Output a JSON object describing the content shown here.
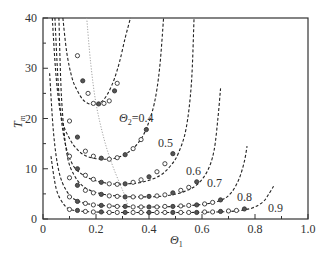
{
  "chart_data": {
    "type": "line",
    "title": "",
    "xlabel": "Θ1",
    "ylabel": "T_m",
    "xlim": [
      0,
      1.0
    ],
    "ylim": [
      0,
      40
    ],
    "xticks": [
      "0",
      "0.2",
      "0.4",
      "0.6",
      "0.8",
      "1.0"
    ],
    "yticks": [
      "0",
      "10",
      "20",
      "30",
      "40"
    ],
    "grid": false,
    "legend": "inline curve labels",
    "series": [
      {
        "name": "Θ2=0.4",
        "label": "Θ2=0.4",
        "x": [
          0.075,
          0.09,
          0.11,
          0.13,
          0.15,
          0.17,
          0.19,
          0.21,
          0.23,
          0.25,
          0.27,
          0.29,
          0.31,
          0.33
        ],
        "y": [
          40,
          33,
          28,
          25.5,
          23.8,
          23.0,
          22.8,
          23.0,
          23.8,
          25.5,
          28,
          31.5,
          36,
          40
        ]
      },
      {
        "name": "Θ2=0.5",
        "label": "0.5",
        "x": [
          0.035,
          0.05,
          0.07,
          0.1,
          0.13,
          0.16,
          0.2,
          0.24,
          0.28,
          0.32,
          0.36,
          0.39,
          0.42,
          0.44,
          0.455
        ],
        "y": [
          40,
          28,
          20,
          16,
          13.8,
          12.6,
          12.0,
          11.9,
          12.2,
          13.2,
          15.2,
          18,
          23,
          30,
          40
        ]
      },
      {
        "name": "Θ2=0.6",
        "label": "0.6",
        "x": [
          0.045,
          0.06,
          0.08,
          0.11,
          0.15,
          0.2,
          0.26,
          0.32,
          0.38,
          0.44,
          0.48,
          0.51,
          0.54,
          0.56,
          0.57
        ],
        "y": [
          40,
          25,
          16,
          11,
          8.8,
          7.6,
          7.0,
          7.0,
          7.4,
          8.6,
          10.5,
          13,
          18,
          27,
          40
        ]
      },
      {
        "name": "Θ2=0.7",
        "label": "0.7",
        "x": [
          0.06,
          0.07,
          0.09,
          0.12,
          0.16,
          0.22,
          0.3,
          0.38,
          0.46,
          0.53,
          0.58,
          0.62,
          0.645,
          0.66,
          0.67
        ],
        "y": [
          40,
          24,
          13,
          8.5,
          6.2,
          5.0,
          4.5,
          4.4,
          4.6,
          5.4,
          6.8,
          9.5,
          13.5,
          20,
          26
        ]
      },
      {
        "name": "Θ2=0.8",
        "label": "0.8",
        "x": [
          0.025,
          0.04,
          0.06,
          0.09,
          0.13,
          0.2,
          0.3,
          0.4,
          0.5,
          0.6,
          0.67,
          0.71,
          0.74,
          0.76,
          0.77
        ],
        "y": [
          29,
          17,
          9.5,
          5.5,
          3.6,
          2.8,
          2.5,
          2.4,
          2.5,
          2.9,
          3.7,
          5.2,
          8,
          11.5,
          14.5
        ]
      },
      {
        "name": "Θ2=0.9",
        "label": "0.9",
        "x": [
          0.03,
          0.05,
          0.08,
          0.11,
          0.16,
          0.25,
          0.35,
          0.45,
          0.55,
          0.65,
          0.73,
          0.79,
          0.83,
          0.85,
          0.87
        ],
        "y": [
          12.5,
          6,
          2.8,
          1.8,
          1.5,
          1.3,
          1.3,
          1.3,
          1.3,
          1.4,
          1.6,
          2.2,
          3.4,
          4.8,
          6.5
        ]
      },
      {
        "name": "minimum locus",
        "style": "dotted-gray",
        "x": [
          0.165,
          0.18,
          0.2,
          0.23,
          0.26,
          0.29,
          0.31,
          0.32
        ],
        "y": [
          40,
          31,
          23,
          16,
          11,
          7,
          4.5,
          2.5
        ]
      }
    ],
    "markers": [
      {
        "series": "Θ2=0.4",
        "x": [
          0.13,
          0.15,
          0.17,
          0.19,
          0.21,
          0.23,
          0.25,
          0.27,
          0.28
        ],
        "y": [
          32.5,
          27.5,
          25,
          23,
          22.9,
          23,
          23.5,
          25.5,
          27
        ]
      },
      {
        "series": "Θ2=0.5",
        "x": [
          0.1,
          0.13,
          0.16,
          0.19,
          0.22,
          0.25,
          0.28,
          0.31,
          0.34,
          0.37,
          0.39
        ],
        "y": [
          19.5,
          16.3,
          13.5,
          12.5,
          12.1,
          11.9,
          12.2,
          12.8,
          14,
          15.8,
          17.8
        ]
      },
      {
        "series": "Θ2=0.6",
        "x": [
          0.1,
          0.13,
          0.16,
          0.19,
          0.22,
          0.25,
          0.28,
          0.31,
          0.34,
          0.37,
          0.4,
          0.43,
          0.46,
          0.49
        ],
        "y": [
          12.5,
          10,
          8.7,
          7.9,
          7.3,
          7.0,
          6.9,
          7.0,
          7.3,
          7.8,
          8.4,
          9.4,
          11,
          13
        ]
      },
      {
        "series": "Θ2=0.7",
        "x": [
          0.1,
          0.13,
          0.16,
          0.19,
          0.22,
          0.25,
          0.28,
          0.31,
          0.34,
          0.37,
          0.4,
          0.43,
          0.46,
          0.49,
          0.52,
          0.55,
          0.58
        ],
        "y": [
          8.2,
          6.7,
          5.7,
          5.2,
          4.9,
          4.6,
          4.5,
          4.4,
          4.4,
          4.4,
          4.5,
          4.6,
          4.8,
          5.2,
          5.7,
          6.3,
          7.4
        ]
      },
      {
        "series": "Θ2=0.8",
        "x": [
          0.1,
          0.13,
          0.16,
          0.19,
          0.22,
          0.25,
          0.28,
          0.31,
          0.34,
          0.37,
          0.4,
          0.43,
          0.46,
          0.49,
          0.52,
          0.55,
          0.58,
          0.61,
          0.64,
          0.67
        ],
        "y": [
          4.4,
          3.5,
          3.1,
          2.8,
          2.7,
          2.6,
          2.5,
          2.5,
          2.4,
          2.4,
          2.4,
          2.4,
          2.5,
          2.5,
          2.6,
          2.7,
          2.8,
          3.0,
          3.3,
          3.8
        ]
      },
      {
        "series": "Θ2=0.9",
        "x": [
          0.1,
          0.13,
          0.16,
          0.19,
          0.22,
          0.25,
          0.28,
          0.31,
          0.34,
          0.37,
          0.4,
          0.43,
          0.46,
          0.49,
          0.52,
          0.55,
          0.58,
          0.61,
          0.64,
          0.67,
          0.7,
          0.73,
          0.76
        ],
        "y": [
          1.9,
          1.7,
          1.5,
          1.4,
          1.4,
          1.3,
          1.3,
          1.3,
          1.3,
          1.3,
          1.3,
          1.3,
          1.3,
          1.3,
          1.3,
          1.3,
          1.3,
          1.4,
          1.4,
          1.5,
          1.6,
          1.7,
          2.0
        ]
      }
    ],
    "annotations": [
      {
        "text": "Θ2=0.4",
        "x": 0.28,
        "y": 20.5
      },
      {
        "text": "0.5",
        "x": 0.425,
        "y": 14.7
      },
      {
        "text": "0.6",
        "x": 0.53,
        "y": 9.5
      },
      {
        "text": "0.7",
        "x": 0.63,
        "y": 6.8
      },
      {
        "text": "0.8",
        "x": 0.74,
        "y": 3.8
      },
      {
        "text": "0.9",
        "x": 0.855,
        "y": 1.3
      }
    ]
  },
  "plot": {
    "left": 43,
    "top": 18,
    "right": 308,
    "bottom": 219
  },
  "axes": {
    "xlabel_main": "Θ",
    "xlabel_sub": "1",
    "ylabel_main": "T",
    "ylabel_sub": "m"
  },
  "labels": {
    "theta2_main": "Θ",
    "theta2_sub": "2",
    "theta2_value": "=0.4",
    "c05": "0.5",
    "c06": "0.6",
    "c07": "0.7",
    "c08": "0.8",
    "c09": "0.9"
  },
  "colors": {
    "axis": "#333333",
    "curve": "#222222",
    "locus": "#999999",
    "marker": "#333333"
  }
}
